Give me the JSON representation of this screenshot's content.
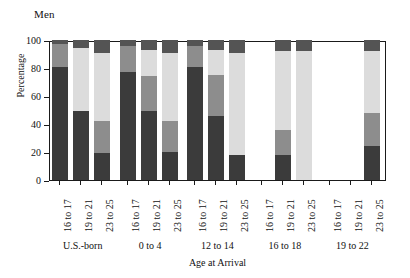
{
  "chart_data": {
    "type": "bar",
    "subtype": "stacked-percentage-grouped",
    "title": "Men",
    "xlabel": "Age at Arrival",
    "ylabel": "Percentage",
    "ylim": [
      0,
      100
    ],
    "yticks": [
      0,
      20,
      40,
      60,
      80,
      100
    ],
    "grid": false,
    "legend": "none",
    "categories": [
      "16 to 17",
      "19 to 21",
      "23 to 25"
    ],
    "groups": [
      "U.S.-born",
      "0 to 4",
      "12 to 14",
      "16 to 18",
      "19 to 22"
    ],
    "series": [
      {
        "name": "segment-1-dark",
        "color": "#3b3b3b"
      },
      {
        "name": "segment-2-medium",
        "color": "#8d8d8d"
      },
      {
        "name": "segment-3-light",
        "color": "#dcdcdc"
      },
      {
        "name": "segment-4-topdark",
        "color": "#545454"
      }
    ],
    "bars": [
      {
        "group": "U.S.-born",
        "category": "16 to 17",
        "present": true,
        "values": [
          81,
          16,
          0,
          3
        ]
      },
      {
        "group": "U.S.-born",
        "category": "19 to 21",
        "present": true,
        "values": [
          49,
          0,
          45,
          6
        ]
      },
      {
        "group": "U.S.-born",
        "category": "23 to 25",
        "present": true,
        "values": [
          19,
          23,
          49,
          9
        ]
      },
      {
        "group": "0 to 4",
        "category": "16 to 17",
        "present": true,
        "values": [
          77,
          19,
          0,
          4
        ]
      },
      {
        "group": "0 to 4",
        "category": "19 to 21",
        "present": true,
        "values": [
          49,
          25,
          19,
          7
        ]
      },
      {
        "group": "0 to 4",
        "category": "23 to 25",
        "present": true,
        "values": [
          20,
          22,
          49,
          9
        ]
      },
      {
        "group": "12 to 14",
        "category": "16 to 17",
        "present": true,
        "values": [
          81,
          15,
          0,
          4
        ]
      },
      {
        "group": "12 to 14",
        "category": "19 to 21",
        "present": true,
        "values": [
          46,
          29,
          18,
          7
        ]
      },
      {
        "group": "12 to 14",
        "category": "23 to 25",
        "present": true,
        "values": [
          18,
          0,
          73,
          9
        ]
      },
      {
        "group": "16 to 18",
        "category": "16 to 17",
        "present": false,
        "values": [
          0,
          0,
          0,
          0
        ]
      },
      {
        "group": "16 to 18",
        "category": "19 to 21",
        "present": true,
        "values": [
          18,
          18,
          56,
          8
        ]
      },
      {
        "group": "16 to 18",
        "category": "23 to 25",
        "present": true,
        "values": [
          0,
          0,
          92,
          8
        ]
      },
      {
        "group": "19 to 22",
        "category": "16 to 17",
        "present": false,
        "values": [
          0,
          0,
          0,
          0
        ]
      },
      {
        "group": "19 to 22",
        "category": "19 to 21",
        "present": false,
        "values": [
          0,
          0,
          0,
          0
        ]
      },
      {
        "group": "19 to 22",
        "category": "23 to 25",
        "present": true,
        "values": [
          24,
          24,
          44,
          8
        ]
      }
    ]
  },
  "axis": {
    "ytick_labels": [
      "0",
      "20",
      "40",
      "60",
      "80",
      "100"
    ],
    "xcat_labels": [
      "16 to 17",
      "19 to 21",
      "23 to 25"
    ]
  }
}
